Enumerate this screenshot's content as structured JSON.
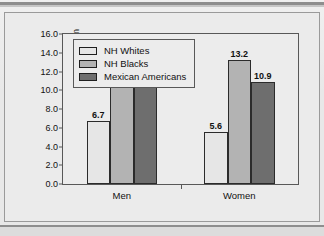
{
  "chart_data": {
    "type": "bar",
    "title": "",
    "xlabel": "",
    "ylabel": "Percent of Population",
    "categories": [
      "Men",
      "Women"
    ],
    "series": [
      {
        "name": "NH Whites",
        "values": [
          6.7,
          5.6
        ],
        "color": "#e6e6e6"
      },
      {
        "name": "NH Blacks",
        "values": [
          10.7,
          13.2
        ],
        "color": "#b3b3b3"
      },
      {
        "name": "Mexican Americans",
        "values": [
          11.0,
          10.9
        ],
        "color": "#6e6e6e"
      }
    ],
    "ylim": [
      0.0,
      16.0
    ],
    "ytick_labels": [
      "0.0",
      "2.0",
      "4.0",
      "6.0",
      "8.0",
      "10.0",
      "12.0",
      "14.0",
      "16.0"
    ],
    "ytick_values": [
      0,
      2,
      4,
      6,
      8,
      10,
      12,
      14,
      16
    ],
    "grid": false,
    "legend_position": "top-left",
    "data_labels": [
      "6.7",
      "10.7",
      "11.0",
      "5.6",
      "13.2",
      "10.9"
    ]
  },
  "legend": {
    "items": [
      {
        "label": "NH Whites"
      },
      {
        "label": "NH Blacks"
      },
      {
        "label": "Mexican Americans"
      }
    ]
  },
  "axis": {
    "y_title": "Percent of Population"
  }
}
